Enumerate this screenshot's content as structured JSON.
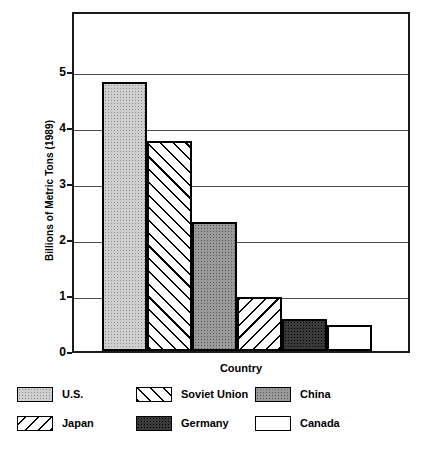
{
  "chart_data": {
    "type": "bar",
    "title": "",
    "xlabel": "Country",
    "ylabel": "Billions of Metric Tons (1989)",
    "categories": [
      "U.S.",
      "Soviet Union",
      "China",
      "Japan",
      "Germany",
      "Canada"
    ],
    "values": [
      4.8,
      3.75,
      2.3,
      0.97,
      0.57,
      0.47
    ],
    "ylim": [
      0,
      5.9
    ],
    "yticks": [
      0,
      1,
      2,
      3,
      4,
      5
    ],
    "ytick_labels": [
      "0",
      "1",
      "2",
      "3",
      "4",
      "5"
    ],
    "grid": "horizontal",
    "legend_position": "bottom",
    "series": [
      {
        "name": "Carbon Dioxide Emissions",
        "values": [
          4.8,
          3.75,
          2.3,
          0.97,
          0.57,
          0.47
        ]
      }
    ],
    "bar_patterns": [
      "stipple-light",
      "hatch-forward",
      "stipple-medium",
      "hatch-backward",
      "stipple-dark",
      "solid-white"
    ]
  },
  "axes": {
    "y_title": "Billions of Metric Tons (1989)",
    "x_title": "Country",
    "ticks": [
      {
        "label": "5",
        "value": 5
      },
      {
        "label": "4",
        "value": 4
      },
      {
        "label": "3",
        "value": 3
      },
      {
        "label": "2",
        "value": 2
      },
      {
        "label": "1",
        "value": 1
      },
      {
        "label": "0",
        "value": 0
      }
    ]
  },
  "legend": {
    "items": [
      {
        "label": "U.S.",
        "pattern": "stipple-light",
        "row": 0,
        "col": 0
      },
      {
        "label": "Soviet Union",
        "pattern": "hatch-forward",
        "row": 0,
        "col": 1
      },
      {
        "label": "China",
        "pattern": "stipple-medium",
        "row": 0,
        "col": 2
      },
      {
        "label": "Japan",
        "pattern": "hatch-backward",
        "row": 1,
        "col": 0
      },
      {
        "label": "Germany",
        "pattern": "stipple-dark",
        "row": 1,
        "col": 1
      },
      {
        "label": "Canada",
        "pattern": "solid-white",
        "row": 1,
        "col": 2
      }
    ]
  },
  "colors": {
    "axis": "#1a1a1a",
    "grid": "#4d4d4d",
    "background": "#ffffff",
    "stipple_light": "#cfcfcf",
    "stipple_medium": "#9a9a9a",
    "stipple_dark": "#3a3a3a",
    "solid_white": "#ffffff"
  }
}
